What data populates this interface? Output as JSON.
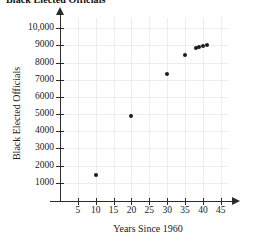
{
  "clipped_header": "Black Elected Officials",
  "chart_data": {
    "type": "scatter",
    "title": "Black Elected Officials",
    "xlabel": "Years Since 1960",
    "ylabel": "Black Elected Officials",
    "xlim": [
      0,
      47
    ],
    "ylim": [
      0,
      10600
    ],
    "grid": true,
    "legend": "none",
    "xticks": [
      5,
      10,
      15,
      20,
      25,
      30,
      35,
      40,
      45
    ],
    "xtick_labels": [
      "5",
      "10",
      "15",
      "20",
      "25",
      "30",
      "35",
      "40",
      "45"
    ],
    "yticks": [
      1000,
      2000,
      3000,
      4000,
      5000,
      6000,
      7000,
      8000,
      9000,
      10000
    ],
    "ytick_labels": [
      "1000",
      "2000",
      "3000",
      "4000",
      "5000",
      "6000",
      "7000",
      "8000",
      "9000",
      "10,000"
    ],
    "points": [
      {
        "x": 10,
        "y": 1480
      },
      {
        "x": 20,
        "y": 4890
      },
      {
        "x": 30,
        "y": 7335
      },
      {
        "x": 35,
        "y": 8420
      },
      {
        "x": 38,
        "y": 8830
      },
      {
        "x": 39,
        "y": 8900
      },
      {
        "x": 40,
        "y": 8960
      },
      {
        "x": 41,
        "y": 9040
      }
    ],
    "marker": "filled-circle",
    "marker_color": "#1c1c1c",
    "grid_color": "#ededed",
    "axis_color": "#2b2b2b"
  }
}
